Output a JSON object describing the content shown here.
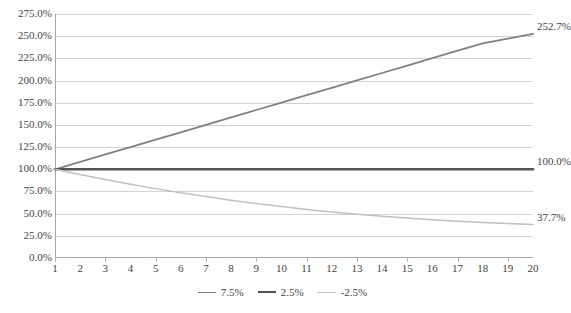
{
  "chart_data": {
    "type": "line",
    "title": "",
    "subtitle": "",
    "xlabel": "",
    "ylabel": "",
    "x": [
      1,
      2,
      3,
      4,
      5,
      6,
      7,
      8,
      9,
      10,
      11,
      12,
      13,
      14,
      15,
      16,
      17,
      18,
      19,
      20
    ],
    "xtick_labels": [
      "1",
      "2",
      "3",
      "4",
      "5",
      "6",
      "7",
      "8",
      "9",
      "10",
      "11",
      "12",
      "13",
      "14",
      "15",
      "16",
      "17",
      "18",
      "19",
      "20"
    ],
    "ytick_labels": [
      "275.0%",
      "250.0%",
      "225.0%",
      "200.0%",
      "175.0%",
      "150.0%",
      "125.0%",
      "100.0%",
      "75.0%",
      "50.0%",
      "25.0%",
      "0.0%"
    ],
    "ytick_values": [
      275,
      250,
      225,
      200,
      175,
      150,
      125,
      100,
      75,
      50,
      25,
      0
    ],
    "ylim": [
      0,
      275
    ],
    "xlim": [
      1,
      20
    ],
    "grid": true,
    "grid_axis": "y",
    "legend_position": "bottom",
    "series": [
      {
        "name": "7.5%",
        "color": "#808080",
        "width": 1.8,
        "end_label": "252.7%",
        "values": [
          100.0,
          107.5,
          115.6,
          124.2,
          133.5,
          143.6,
          154.3,
          165.9,
          178.3,
          191.6,
          206.0,
          221.5,
          238.1,
          255.9,
          275.1,
          295.7,
          317.9,
          341.7,
          367.4,
          252.7
        ]
      },
      {
        "name": "2.5%",
        "color": "#545454",
        "width": 2.6,
        "end_label": "100.0%",
        "values": [
          100.0,
          100.0,
          100.0,
          100.0,
          100.0,
          100.0,
          100.0,
          100.0,
          100.0,
          100.0,
          100.0,
          100.0,
          100.0,
          100.0,
          100.0,
          100.0,
          100.0,
          100.0,
          100.0,
          100.0
        ]
      },
      {
        "name": "-2.5%",
        "color": "#c0c0c0",
        "width": 1.5,
        "end_label": "37.7%",
        "values": [
          100.0,
          95.0,
          90.2,
          85.8,
          81.5,
          77.4,
          73.5,
          69.8,
          66.3,
          63.0,
          59.9,
          56.9,
          54.0,
          51.3,
          48.7,
          46.3,
          44.0,
          41.8,
          39.7,
          37.7
        ]
      }
    ],
    "plotted_series": [
      {
        "name": "7.5%",
        "points": [
          100.0,
          108.3,
          116.7,
          125.0,
          133.4,
          141.7,
          150.1,
          158.4,
          166.8,
          175.1,
          183.5,
          191.8,
          200.2,
          208.5,
          216.9,
          225.2,
          233.6,
          241.9,
          247.3,
          252.7
        ]
      },
      {
        "name": "2.5%",
        "points": [
          100.0,
          100.0,
          100.0,
          100.0,
          100.0,
          100.0,
          100.0,
          100.0,
          100.0,
          100.0,
          100.0,
          100.0,
          100.0,
          100.0,
          100.0,
          100.0,
          100.0,
          100.0,
          100.0,
          100.0
        ]
      },
      {
        "name": "-2.5%",
        "points": [
          100.0,
          94.0,
          88.4,
          83.1,
          78.2,
          73.5,
          69.2,
          65.2,
          61.4,
          58.0,
          54.8,
          51.9,
          49.3,
          47.0,
          45.0,
          43.2,
          41.5,
          40.0,
          38.8,
          37.7
        ]
      }
    ]
  },
  "legend": {
    "items": [
      {
        "label": "7.5%",
        "color": "#808080"
      },
      {
        "label": "2.5%",
        "color": "#545454"
      },
      {
        "label": "-2.5%",
        "color": "#c0c0c0"
      }
    ]
  },
  "data_labels": [
    {
      "text": "252.7%",
      "series": "7.5%"
    },
    {
      "text": "100.0%",
      "series": "2.5%"
    },
    {
      "text": "37.7%",
      "series": "-2.5%"
    }
  ]
}
